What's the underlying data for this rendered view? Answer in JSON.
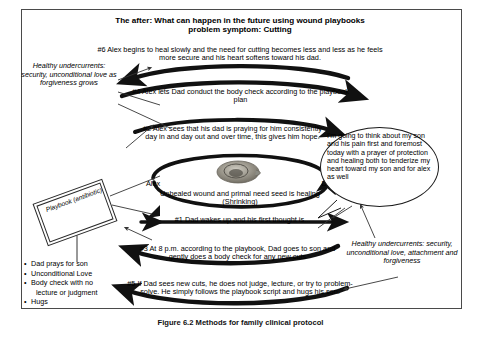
{
  "title": "The after: What can happen in the future using wound playbooks problem symptom: Cutting",
  "title_line1": "The after: What can happen in the future using wound playbooks",
  "title_line2": "problem symptom: Cutting",
  "steps": {
    "step6": "#6 Alex begins to heal slowly and the need for cutting becomes less and less as he feels more secure and his heart softens toward his dad.",
    "step4": "#4 Alex lets Dad conduct the body check according to the playbook plan",
    "step2": "#2 Alex sees that his dad is praying for him consistently day in and day out and over time, this gives him hope.",
    "step1": "#1 Dad wakes up and his first thought is...",
    "step3": "#3 At 8 p.m. according to the playbook, Dad goes to son and gently does a body check for any new cuts",
    "step5": "#5 If Dad sees new cuts, he does not judge, lecture, or try to problem-solve. He simply follows the playbook script and hugs his son."
  },
  "center": {
    "left_label": "Alex",
    "right_label": "Dad",
    "seed_caption": "Unhealed wound and primal need seed is healing (Shrinking)"
  },
  "bubble": {
    "text": "I'm going to think about my son and his pain first and foremost today with a prayer of protection and healing both to tenderize my heart toward my son and for alex as well"
  },
  "undercurrents": {
    "left": "Healthy undercurrents: security, unconditional love as forgiveness grows",
    "right": "Healthy undercurrents: security, unconditional love, attachment and forgiveness"
  },
  "playbook": {
    "label": "Playbook (antibiotic)",
    "bullets": [
      "Dad prays for son",
      "Unconditional Love",
      "Body check with no",
      "lecture or judgment",
      "Hugs"
    ]
  },
  "figure_caption": "Figure 6.2 Methods for family clinical protocol",
  "colors": {
    "frame": "#4a4a4a",
    "arrow": "#111111",
    "seed": "#8a8a82"
  }
}
